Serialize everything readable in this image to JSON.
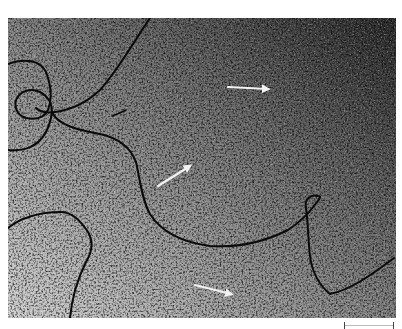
{
  "figure": {
    "type": "electron micrograph",
    "background": {
      "light": "#c8c8c8",
      "dark": "#2a2a2a",
      "strand_color": "#0a0a0a",
      "arrow_color": "#f2f2f2"
    },
    "arrows": [
      {
        "name": "arrow-top-right",
        "x1": 228,
        "y1": 87,
        "x2": 270,
        "y2": 89
      },
      {
        "name": "arrow-center",
        "x1": 158,
        "y1": 186,
        "x2": 192,
        "y2": 165
      },
      {
        "name": "arrow-bottom",
        "x1": 195,
        "y1": 285,
        "x2": 233,
        "y2": 294
      }
    ],
    "scale_bar": {
      "length_px": 50,
      "label": ""
    }
  }
}
